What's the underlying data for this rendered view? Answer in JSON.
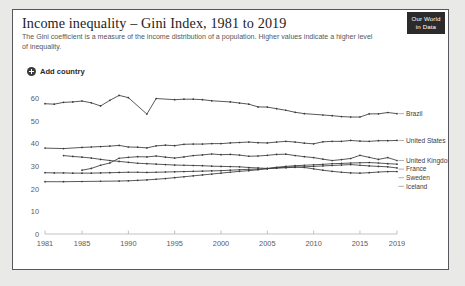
{
  "badge": {
    "line1": "Our World",
    "line2": "in Data"
  },
  "header": {
    "title": "Income inequality – Gini Index, 1981 to 2019",
    "subtitle": "The Gini coefficient is a measure of the income distribution of a population. Higher values indicate a higher level of inequality."
  },
  "controls": {
    "add_country_label": "Add country",
    "add_country_icon": "plus-circle-icon"
  },
  "chart_data": {
    "type": "line",
    "title": "Income inequality – Gini Index, 1981 to 2019",
    "subtitle": "The Gini coefficient is a measure of the income distribution of a population. Higher values indicate a higher level of inequality.",
    "xlabel": "",
    "ylabel": "",
    "xlim": [
      1981,
      2019
    ],
    "ylim": [
      0,
      63
    ],
    "y_ticks": [
      0,
      10,
      20,
      30,
      40,
      50,
      60
    ],
    "x_ticks": [
      1981,
      1985,
      1990,
      1995,
      2000,
      2005,
      2010,
      2015,
      2019
    ],
    "grid": false,
    "legend_position": "right-inline",
    "line_color": "#3a3a3a",
    "series": [
      {
        "name": "Brazil",
        "x": [
          1981,
          1982,
          1983,
          1984,
          1985,
          1986,
          1987,
          1988,
          1989,
          1990,
          1992,
          1993,
          1995,
          1996,
          1997,
          1998,
          1999,
          2001,
          2002,
          2003,
          2004,
          2005,
          2006,
          2007,
          2008,
          2009,
          2011,
          2012,
          2013,
          2014,
          2015,
          2016,
          2017,
          2018,
          2019
        ],
        "values": [
          57.8,
          57.6,
          58.4,
          58.6,
          59.0,
          58.2,
          56.8,
          59.3,
          61.5,
          60.5,
          53.2,
          60.1,
          59.6,
          59.8,
          59.8,
          59.6,
          59.1,
          58.6,
          58.1,
          57.6,
          56.4,
          56.3,
          55.6,
          54.9,
          54.0,
          53.4,
          52.8,
          52.5,
          52.1,
          51.9,
          51.9,
          53.3,
          53.3,
          53.9,
          53.4
        ]
      },
      {
        "name": "United States",
        "x": [
          1981,
          1983,
          1985,
          1986,
          1987,
          1988,
          1989,
          1990,
          1991,
          1992,
          1993,
          1994,
          1995,
          1996,
          1997,
          1998,
          1999,
          2000,
          2001,
          2002,
          2003,
          2004,
          2005,
          2006,
          2007,
          2008,
          2009,
          2010,
          2011,
          2012,
          2013,
          2014,
          2015,
          2016,
          2017,
          2018,
          2019
        ],
        "values": [
          38.1,
          37.9,
          38.4,
          38.6,
          38.8,
          39.0,
          39.3,
          38.6,
          38.5,
          38.2,
          39.1,
          39.4,
          39.2,
          39.8,
          39.9,
          39.9,
          40.1,
          40.1,
          40.4,
          40.6,
          40.8,
          40.5,
          40.4,
          40.8,
          41.1,
          40.8,
          40.3,
          40.0,
          40.9,
          41.1,
          41.1,
          41.5,
          41.2,
          41.1,
          41.4,
          41.4,
          41.5
        ]
      },
      {
        "name": "United Kingdom",
        "x": [
          1985,
          1986,
          1987,
          1988,
          1989,
          1990,
          1991,
          1992,
          1993,
          1994,
          1995,
          1996,
          1997,
          1998,
          1999,
          2000,
          2001,
          2002,
          2003,
          2004,
          2005,
          2006,
          2007,
          2008,
          2009,
          2010,
          2011,
          2012,
          2013,
          2014,
          2015,
          2016,
          2017,
          2018,
          2019
        ],
        "values": [
          28.3,
          29.1,
          30.5,
          31.5,
          33.6,
          34.0,
          34.3,
          34.2,
          34.6,
          34.1,
          33.7,
          34.2,
          34.8,
          35.1,
          35.5,
          35.2,
          35.3,
          35.0,
          34.5,
          34.6,
          34.9,
          35.3,
          35.4,
          34.8,
          34.3,
          33.9,
          33.2,
          32.6,
          33.0,
          33.5,
          34.9,
          34.0,
          33.1,
          33.9,
          32.6
        ]
      },
      {
        "name": "France",
        "x": [
          1983,
          1984,
          1985,
          1986,
          1987,
          1988,
          1989,
          1990,
          1991,
          1992,
          1993,
          1994,
          1995,
          1996,
          1997,
          1998,
          1999,
          2000,
          2001,
          2002,
          2003,
          2004,
          2005,
          2006,
          2007,
          2008,
          2009,
          2010,
          2011,
          2012,
          2013,
          2014,
          2015,
          2016,
          2017,
          2018,
          2019
        ],
        "values": [
          34.8,
          34.4,
          34.1,
          33.7,
          33.1,
          32.6,
          32.2,
          31.8,
          31.4,
          31.2,
          31.0,
          30.8,
          30.6,
          30.5,
          30.4,
          30.3,
          30.1,
          30.0,
          29.9,
          29.8,
          29.5,
          29.3,
          29.1,
          29.6,
          30.0,
          30.3,
          30.5,
          30.7,
          30.9,
          31.2,
          31.3,
          31.5,
          31.6,
          31.7,
          31.5,
          31.2,
          31.0
        ]
      },
      {
        "name": "Sweden",
        "x": [
          1981,
          1982,
          1983,
          1984,
          1985,
          1986,
          1987,
          1988,
          1989,
          1990,
          1991,
          1992,
          1993,
          1994,
          1995,
          1996,
          1997,
          1998,
          1999,
          2000,
          2001,
          2002,
          2003,
          2004,
          2005,
          2006,
          2007,
          2008,
          2009,
          2010,
          2011,
          2012,
          2013,
          2014,
          2015,
          2016,
          2017,
          2018,
          2019
        ],
        "values": [
          27.2,
          27.1,
          27.1,
          27.0,
          27.0,
          27.0,
          27.1,
          27.2,
          27.3,
          27.4,
          27.4,
          27.3,
          27.4,
          27.5,
          27.6,
          27.7,
          27.8,
          27.9,
          28.0,
          28.1,
          28.3,
          28.5,
          28.7,
          28.8,
          29.0,
          29.2,
          29.4,
          29.6,
          29.8,
          30.0,
          30.2,
          30.4,
          30.6,
          30.8,
          30.5,
          30.2,
          30.0,
          29.8,
          29.3
        ]
      },
      {
        "name": "Iceland",
        "x": [
          1981,
          1983,
          1985,
          1987,
          1989,
          1990,
          1991,
          1992,
          1993,
          1994,
          1995,
          1996,
          1997,
          1998,
          1999,
          2000,
          2001,
          2002,
          2003,
          2004,
          2005,
          2006,
          2007,
          2008,
          2009,
          2010,
          2011,
          2012,
          2013,
          2014,
          2015,
          2016,
          2017,
          2018,
          2019
        ],
        "values": [
          23.2,
          23.2,
          23.3,
          23.4,
          23.5,
          23.6,
          23.8,
          24.0,
          24.3,
          24.6,
          25.0,
          25.4,
          25.8,
          26.2,
          26.6,
          27.0,
          27.4,
          27.8,
          28.1,
          28.5,
          29.0,
          29.4,
          29.6,
          29.8,
          29.5,
          28.9,
          28.3,
          27.8,
          27.4,
          27.1,
          27.0,
          27.2,
          27.5,
          27.7,
          27.7
        ]
      }
    ],
    "legend_entries": [
      {
        "label": "Brazil"
      },
      {
        "label": "United States"
      },
      {
        "label": "United Kingdom"
      },
      {
        "label": "France"
      },
      {
        "label": "Sweden"
      },
      {
        "label": "Iceland"
      }
    ]
  }
}
